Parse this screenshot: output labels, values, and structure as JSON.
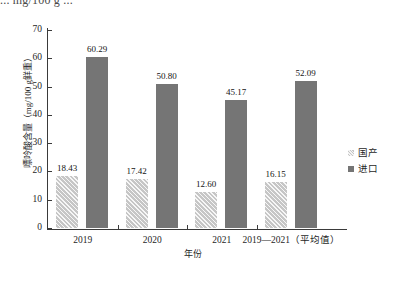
{
  "top_caption": "... mg/100 g ...",
  "chart_data": {
    "type": "bar",
    "title": "",
    "xlabel": "年份",
    "ylabel": "嘌呤酸含量（mg/100 g鲜重）",
    "ylim": [
      0,
      70
    ],
    "ytick_labels": [
      "70",
      "60",
      "50",
      "40",
      "30",
      "20",
      "10",
      "0"
    ],
    "ytick_values": [
      70,
      60,
      50,
      40,
      30,
      20,
      10,
      0
    ],
    "grid": false,
    "legend_position": "right",
    "categories": [
      "2019",
      "2020",
      "2021",
      "2019—2021（平均值）"
    ],
    "series": [
      {
        "name": "国产",
        "color": "#c6c6c6",
        "pattern": "diagonal-hatch",
        "values": [
          18.43,
          17.42,
          12.6,
          16.15
        ],
        "labels": [
          "18.43",
          "17.42",
          "12.60",
          "16.15"
        ]
      },
      {
        "name": "进口",
        "color": "#757575",
        "pattern": "solid",
        "values": [
          60.29,
          50.8,
          45.17,
          52.09
        ],
        "labels": [
          "60.29",
          "50.80",
          "45.17",
          "52.09"
        ]
      }
    ]
  },
  "legend": {
    "items": [
      {
        "label": "国产"
      },
      {
        "label": "进口"
      }
    ]
  }
}
